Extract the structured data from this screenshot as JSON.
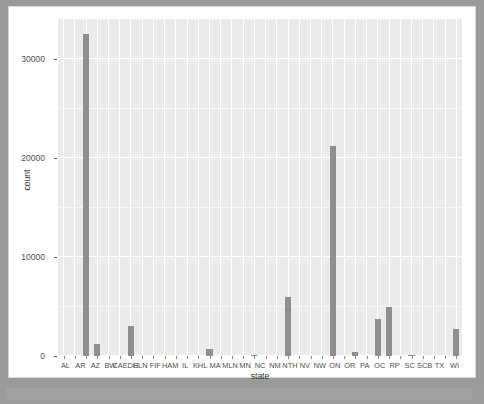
{
  "window": {
    "background_color": "#9a9a9a",
    "content_background": "#ffffff",
    "status_bar_color": "#9c9c9c"
  },
  "chart_data": {
    "type": "bar",
    "title": "",
    "subtitle": "",
    "xlabel": "state",
    "ylabel": "count",
    "ylim": [
      0,
      34000
    ],
    "yticks": [
      0,
      10000,
      20000,
      30000
    ],
    "ytick_labels": [
      "0",
      "10000",
      "20000",
      "30000"
    ],
    "grid": true,
    "legend": "none",
    "panel_color": "#ebebeb",
    "bar_color": "#8f8f8f",
    "gridline_color": "#ffffff",
    "categories": [
      "AL",
      "AR",
      "AZ",
      "BW",
      "CA",
      "ED",
      "H",
      "EL",
      "N",
      "FI",
      "F",
      "HA",
      "M",
      "IL",
      "KH",
      "L",
      "MA",
      "ML",
      "N",
      "MN",
      "NC",
      "NM",
      "NT",
      "H",
      "NV",
      "NW",
      "ON",
      "OR",
      "PA",
      "OC",
      "RP",
      "SC",
      "SC",
      "B",
      "TX",
      "WI"
    ],
    "tick_labels": [
      "AL",
      "AR",
      "AZ",
      "BW",
      "CAEDH",
      "ELN",
      "FIF",
      "HAM",
      "IL",
      "KHL",
      "MA",
      "MLN",
      "MN",
      "NC",
      "NM",
      "NTH",
      "NV",
      "NW",
      "ON",
      "OR",
      "PA",
      "OC",
      "RP",
      "SC",
      "SCB",
      "TX",
      "WI"
    ],
    "values": [
      0,
      0,
      32500,
      1200,
      0,
      0,
      3000,
      0,
      0,
      0,
      0,
      0,
      0,
      700,
      0,
      0,
      0,
      150,
      0,
      0,
      6000,
      0,
      0,
      0,
      21200,
      0,
      400,
      0,
      3700,
      4900,
      0,
      120,
      0,
      0,
      0,
      2700
    ]
  },
  "axes": {
    "y_title": "count",
    "x_title": "state"
  }
}
